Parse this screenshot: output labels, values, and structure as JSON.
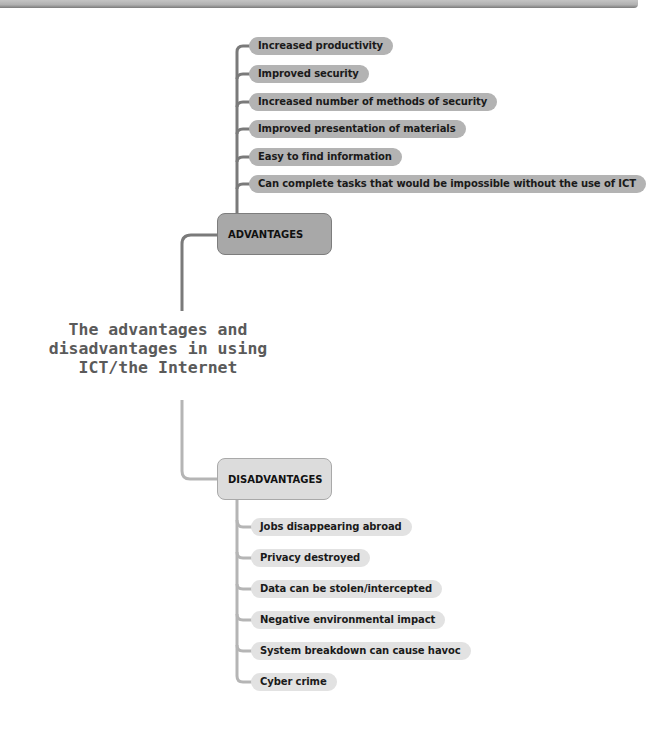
{
  "central_topic": {
    "lines": [
      "The advantages and",
      "disadvantages in using",
      "ICT/the Internet"
    ]
  },
  "advantages": {
    "label": "ADVANTAGES",
    "color": "#a8a8a8",
    "items": [
      "Increased productivity",
      "Improved security",
      "Increased number of methods of security",
      "Improved presentation of materials",
      "Easy to find information",
      "Can complete tasks that would be impossible without the use of ICT"
    ]
  },
  "disadvantages": {
    "label": "DISADVANTAGES",
    "color": "#dcdcdc",
    "items": [
      "Jobs disappearing abroad",
      "Privacy destroyed",
      "Data can be stolen/intercepted",
      "Negative environmental impact",
      "System breakdown can cause havoc",
      "Cyber crime"
    ]
  }
}
